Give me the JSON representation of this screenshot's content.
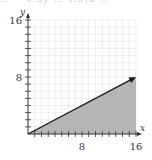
{
  "header_fragment": "… = 0.5y … 1.5(x …",
  "chart_data": {
    "type": "area",
    "title": "",
    "xlabel": "x",
    "ylabel": "y",
    "xlim": [
      0,
      16
    ],
    "ylim": [
      0,
      16
    ],
    "grid": true,
    "x_tick_labels": [
      "8",
      "16"
    ],
    "y_tick_labels": [
      "8",
      "16"
    ],
    "series": [
      {
        "name": "boundary line y = 0.5x",
        "x": [
          0,
          16
        ],
        "y": [
          0,
          8
        ],
        "line_style": "solid",
        "arrow_at_end": true,
        "shaded_region": "below line (y ≤ 0.5x), x from 0 to 16"
      }
    ],
    "colors": {
      "shade": "#a9a9a9",
      "line": "#1a1a1a",
      "grid": "#e2e2e2",
      "axis": "#333333"
    }
  }
}
